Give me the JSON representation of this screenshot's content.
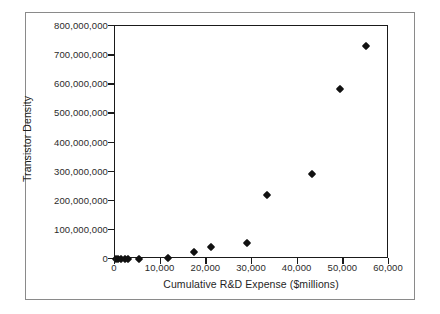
{
  "chart_data": {
    "type": "scatter",
    "title": "",
    "xlabel": "Cumulative R&D Expense ($millions)",
    "ylabel": "Transistor Density",
    "xlim": [
      0,
      60000
    ],
    "ylim": [
      0,
      800000000
    ],
    "grid": false,
    "legend": "none",
    "xticks": [
      0,
      10000,
      20000,
      30000,
      40000,
      50000,
      60000
    ],
    "xtick_labels": [
      "0",
      "10,000",
      "20,000",
      "30,000",
      "40,000",
      "50,000",
      "60,000"
    ],
    "yticks": [
      0,
      100000000,
      200000000,
      300000000,
      400000000,
      500000000,
      600000000,
      700000000,
      800000000
    ],
    "ytick_labels": [
      "0",
      "100,000,000",
      "200,000,000",
      "300,000,000",
      "400,000,000",
      "500,000,000",
      "600,000,000",
      "700,000,000",
      "800,000,000"
    ],
    "marker": "diamond",
    "marker_color": "#111111",
    "points": [
      {
        "x": 200,
        "y": 100000
      },
      {
        "x": 750,
        "y": 300000
      },
      {
        "x": 1300,
        "y": 500000
      },
      {
        "x": 2100,
        "y": 800000
      },
      {
        "x": 2800,
        "y": 1000000
      },
      {
        "x": 5200,
        "y": 1500000
      },
      {
        "x": 11500,
        "y": 5000000
      },
      {
        "x": 17300,
        "y": 24000000
      },
      {
        "x": 21000,
        "y": 42000000
      },
      {
        "x": 29000,
        "y": 54000000
      },
      {
        "x": 33300,
        "y": 221000000
      },
      {
        "x": 43200,
        "y": 293000000
      },
      {
        "x": 49300,
        "y": 583000000
      },
      {
        "x": 55000,
        "y": 730000000
      }
    ]
  },
  "figure": {
    "background_color": "#ffffff",
    "frame_color": "#8a8a8a",
    "axis_color": "#1a1a1a"
  }
}
